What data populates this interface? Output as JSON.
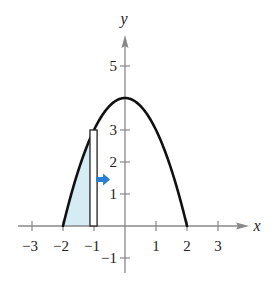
{
  "diagram": {
    "axes": {
      "x_label": "x",
      "y_label": "y",
      "x_ticks": [
        {
          "value": -3,
          "label": "−3"
        },
        {
          "value": -2,
          "label": "−2"
        },
        {
          "value": -1,
          "label": "−1"
        },
        {
          "value": 1,
          "label": "1"
        },
        {
          "value": 2,
          "label": "2"
        },
        {
          "value": 3,
          "label": "3"
        }
      ],
      "y_ticks": [
        {
          "value": -1,
          "label": "−1"
        },
        {
          "value": 1,
          "label": "1"
        },
        {
          "value": 2,
          "label": "2"
        },
        {
          "value": 3,
          "label": "3"
        },
        {
          "value": 5,
          "label": "5"
        }
      ],
      "color": "#888888"
    },
    "curve": {
      "equation": "y = 4 - x^2",
      "x_range": [
        -2,
        2
      ],
      "color": "#111111"
    },
    "shaded_region": {
      "x_range": [
        -2,
        -1.13
      ],
      "color": "#d6ecf5"
    },
    "rectangle": {
      "x_left": -1.13,
      "x_right": -0.9,
      "height": 3,
      "stroke": "#222222",
      "fill": "#ffffff"
    },
    "arrow": {
      "direction": "right",
      "color": "#2b7fd0",
      "y_value": 1.45
    }
  }
}
